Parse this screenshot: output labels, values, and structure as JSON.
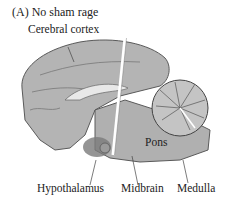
{
  "figure": {
    "panel_title": "(A)  No sham rage",
    "labels": {
      "cerebral_cortex": "Cerebral cortex",
      "pons": "Pons",
      "hypothalamus": "Hypothalamus",
      "midbrain": "Midbrain",
      "medulla": "Medulla"
    },
    "colors": {
      "brain_fill": "#b4b4b4",
      "brain_outline": "#5a5a5a",
      "hypothalamus_shade": "#7a7a7a",
      "cut_line": "#ffffff"
    }
  }
}
